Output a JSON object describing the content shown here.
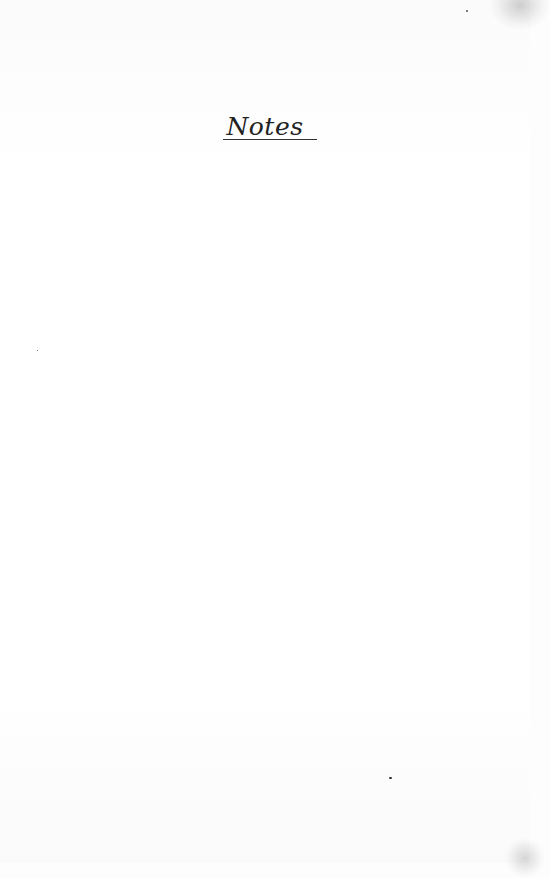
{
  "page": {
    "heading": "Notes"
  }
}
